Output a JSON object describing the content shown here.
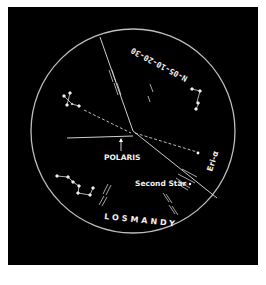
{
  "reticle": {
    "date_code": "N-05-10-20-30",
    "brand": "LOSMANDY",
    "polaris_label": "POLARIS",
    "second_star_label": "Second Star",
    "eri_label": "Eri-α"
  },
  "colors": {
    "background": "#000000",
    "frame": "#ffffff",
    "lines": "#e6e6e6",
    "circle": "#bdbdbd"
  }
}
